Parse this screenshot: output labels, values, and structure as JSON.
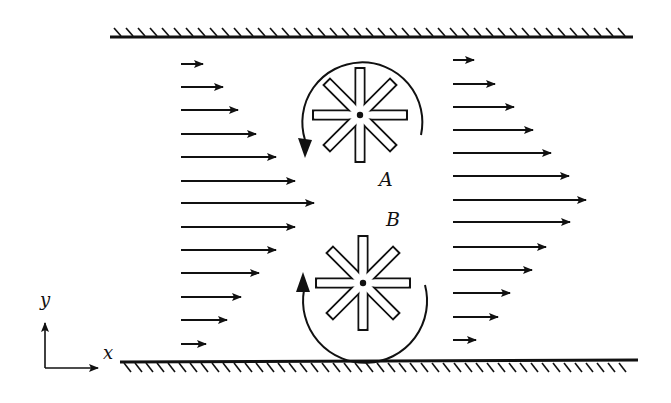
{
  "figure": {
    "type": "channel flow with two paddle wheels",
    "colors": {
      "ink": "#111111",
      "background": "#ffffff"
    }
  },
  "walls": {
    "top": {
      "x1": 110,
      "x2": 633,
      "y": 37,
      "hatch": "above"
    },
    "bottom": {
      "x1": 120,
      "x2": 638,
      "y": 362,
      "hatch": "below"
    }
  },
  "velocity_profiles": {
    "upstream": {
      "x_start": 181,
      "rows": [
        {
          "y": 64,
          "tip": 205
        },
        {
          "y": 87,
          "tip": 225
        },
        {
          "y": 110,
          "tip": 240
        },
        {
          "y": 134,
          "tip": 258
        },
        {
          "y": 157,
          "tip": 278
        },
        {
          "y": 181,
          "tip": 297
        },
        {
          "y": 203,
          "tip": 316
        },
        {
          "y": 227,
          "tip": 297
        },
        {
          "y": 250,
          "tip": 278
        },
        {
          "y": 273,
          "tip": 261
        },
        {
          "y": 297,
          "tip": 243
        },
        {
          "y": 320,
          "tip": 229
        },
        {
          "y": 344,
          "tip": 208
        }
      ]
    },
    "downstream": {
      "x_start": 453,
      "rows": [
        {
          "y": 60,
          "tip": 476
        },
        {
          "y": 84,
          "tip": 497
        },
        {
          "y": 107,
          "tip": 516
        },
        {
          "y": 130,
          "tip": 535
        },
        {
          "y": 153,
          "tip": 553
        },
        {
          "y": 176,
          "tip": 571
        },
        {
          "y": 200,
          "tip": 588
        },
        {
          "y": 222,
          "tip": 572
        },
        {
          "y": 247,
          "tip": 548
        },
        {
          "y": 270,
          "tip": 534
        },
        {
          "y": 293,
          "tip": 512
        },
        {
          "y": 317,
          "tip": 500
        },
        {
          "y": 340,
          "tip": 478
        }
      ]
    }
  },
  "wheels": [
    {
      "id": "A",
      "label": "A",
      "cx": 360,
      "cy": 115,
      "arm_length": 47,
      "arm_width": 9,
      "rotation": "counterclockwise"
    },
    {
      "id": "B",
      "label": "B",
      "cx": 363,
      "cy": 283,
      "arm_length": 47,
      "arm_width": 9,
      "rotation": "clockwise"
    }
  ],
  "rotation_arrows": {
    "A": {
      "path": "M 421 135 A 60 60 0 1 0 305 140",
      "head": "305,158 298,138 312,140"
    },
    "B": {
      "path": "M 425 285 A 62 62 0 1 1 304 290",
      "head": "303,272 296,292 310,292"
    }
  },
  "axes": {
    "origin": {
      "x": 45,
      "y": 368
    },
    "y_label": "y",
    "x_label": "x"
  },
  "labels": {
    "wheel_a": "A",
    "wheel_b": "B"
  }
}
